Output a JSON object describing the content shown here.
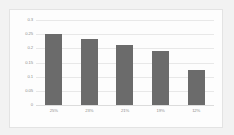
{
  "chart_data": {
    "type": "bar",
    "title": "",
    "subtitle": "",
    "xlabel": "",
    "ylabel": "",
    "categories": [
      "25%",
      "23%",
      "21%",
      "19%",
      "12%"
    ],
    "values": [
      0.249,
      0.232,
      0.212,
      0.192,
      0.122
    ],
    "series": [
      {
        "name": "",
        "values": [
          0.249,
          0.232,
          0.212,
          0.192,
          0.122
        ]
      }
    ],
    "ylim": [
      0,
      0.3
    ],
    "yticks": [
      0,
      0.05,
      0.1,
      0.15,
      0.2,
      0.25,
      0.3
    ],
    "ytick_labels": [
      "0",
      "0.05",
      "0.1",
      "0.15",
      "0.2",
      "0.25",
      "0.3"
    ],
    "grid": true,
    "legend": false,
    "legend_position": "none",
    "colors": {
      "bar": "#6b6b6b",
      "gridline": "#e8e8e8",
      "plot_background": "#fdfdfd",
      "page_background": "#f2f2f2",
      "border": "#e3e3e3",
      "tick_text": "#8d8d8d"
    }
  }
}
